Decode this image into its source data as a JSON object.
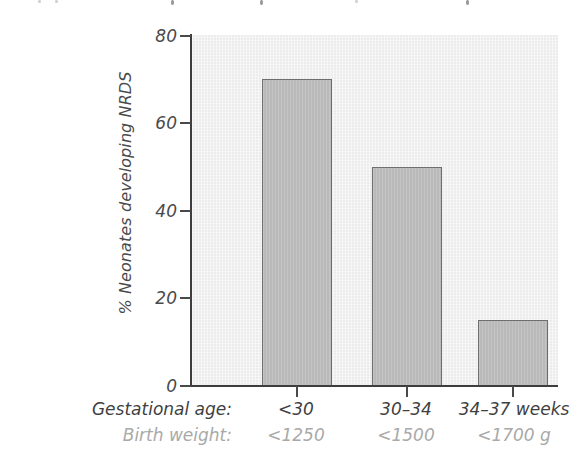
{
  "chart_data": {
    "type": "bar",
    "title": "",
    "xlabel": "Gestational age / Birth weight",
    "ylabel": "% Neonates developing NRDS",
    "ylim": [
      0,
      80
    ],
    "yticks": [
      0,
      20,
      40,
      60,
      80
    ],
    "ytick_labels": [
      "0",
      "20",
      "40",
      "60",
      "80"
    ],
    "grid": false,
    "legend": null,
    "categories": [
      "<30",
      "30–34",
      "34–37 weeks"
    ],
    "values": [
      70,
      50,
      15
    ],
    "secondary_categories": [
      "<1250",
      "<1500",
      "<1700 g"
    ],
    "row_labels": {
      "primary": "Gestational age:",
      "secondary": "Birth weight:"
    },
    "bars": [
      {
        "category": "<30",
        "birth_weight": "<1250",
        "value": 70
      },
      {
        "category": "30–34",
        "birth_weight": "<1500",
        "value": 50
      },
      {
        "category": "34–37 weeks",
        "birth_weight": "<1700 g",
        "value": 15
      }
    ]
  },
  "colors": {
    "bar_fill": "#b9b9b9",
    "bar_stroke": "#6e6e6e",
    "plot_background": "#ececec",
    "axis": "#3d3d3d",
    "primary_text": "#3f3f3f",
    "secondary_text": "#a9a9a9",
    "page_background": "#ffffff"
  }
}
